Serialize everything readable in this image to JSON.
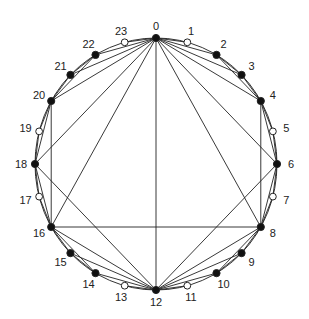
{
  "diagram": {
    "type": "circular-graph",
    "center": [
      156,
      164
    ],
    "radius_x": 121,
    "radius_y": 126,
    "point_count": 24,
    "line_color": "#222222",
    "circle_color": "#333333",
    "points": [
      {
        "label": "0",
        "filled": true
      },
      {
        "label": "1",
        "filled": false
      },
      {
        "label": "2",
        "filled": true
      },
      {
        "label": "3",
        "filled": true
      },
      {
        "label": "4",
        "filled": true
      },
      {
        "label": "5",
        "filled": false
      },
      {
        "label": "6",
        "filled": true
      },
      {
        "label": "7",
        "filled": false
      },
      {
        "label": "8",
        "filled": true
      },
      {
        "label": "9",
        "filled": true
      },
      {
        "label": "10",
        "filled": true
      },
      {
        "label": "11",
        "filled": false
      },
      {
        "label": "12",
        "filled": true
      },
      {
        "label": "13",
        "filled": false
      },
      {
        "label": "14",
        "filled": true
      },
      {
        "label": "15",
        "filled": true
      },
      {
        "label": "16",
        "filled": true
      },
      {
        "label": "17",
        "filled": false
      },
      {
        "label": "18",
        "filled": true
      },
      {
        "label": "19",
        "filled": false
      },
      {
        "label": "20",
        "filled": true
      },
      {
        "label": "21",
        "filled": true
      },
      {
        "label": "22",
        "filled": true
      },
      {
        "label": "23",
        "filled": false
      }
    ],
    "edges": [
      [
        0,
        1
      ],
      [
        0,
        2
      ],
      [
        0,
        3
      ],
      [
        0,
        4
      ],
      [
        0,
        6
      ],
      [
        0,
        8
      ],
      [
        0,
        12
      ],
      [
        0,
        16
      ],
      [
        0,
        18
      ],
      [
        0,
        20
      ],
      [
        0,
        21
      ],
      [
        0,
        22
      ],
      [
        0,
        23
      ],
      [
        12,
        11
      ],
      [
        12,
        10
      ],
      [
        12,
        9
      ],
      [
        12,
        8
      ],
      [
        12,
        6
      ],
      [
        12,
        13
      ],
      [
        12,
        14
      ],
      [
        12,
        15
      ],
      [
        12,
        16
      ],
      [
        12,
        18
      ],
      [
        16,
        8
      ],
      [
        20,
        16
      ],
      [
        4,
        8
      ],
      [
        2,
        3
      ],
      [
        3,
        4
      ],
      [
        2,
        4
      ],
      [
        4,
        5
      ],
      [
        5,
        6
      ],
      [
        4,
        6
      ],
      [
        6,
        7
      ],
      [
        7,
        8
      ],
      [
        6,
        8
      ],
      [
        8,
        9
      ],
      [
        9,
        10
      ],
      [
        8,
        10
      ],
      [
        14,
        15
      ],
      [
        15,
        16
      ],
      [
        14,
        16
      ],
      [
        16,
        17
      ],
      [
        17,
        18
      ],
      [
        16,
        18
      ],
      [
        18,
        19
      ],
      [
        19,
        20
      ],
      [
        18,
        20
      ],
      [
        20,
        21
      ],
      [
        21,
        22
      ],
      [
        20,
        22
      ]
    ]
  }
}
